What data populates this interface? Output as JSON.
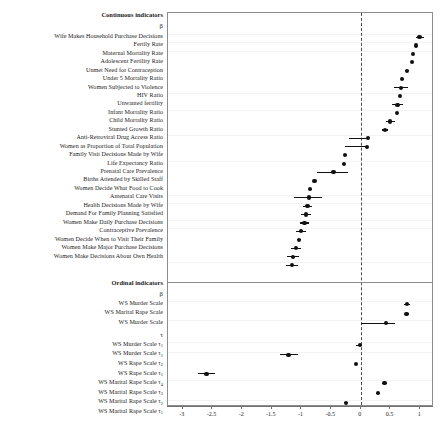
{
  "figure": {
    "type": "forest-plot",
    "sections": [
      {
        "id": "continuous",
        "title": "Continuous indicators",
        "param_header": "β"
      },
      {
        "id": "ordinal",
        "title": "Ordinal indicators",
        "param_header": "β",
        "second_param_header": "τ"
      }
    ]
  },
  "axis": {
    "ticks": [
      -3,
      -2.5,
      -2,
      -1.5,
      -1,
      -0.5,
      0,
      0.5,
      1
    ],
    "tick_labels": [
      "-3",
      "-2.5",
      "-2",
      "-1.5",
      "-1",
      "-0.5",
      "0",
      "0.5",
      "1"
    ],
    "min": -3.25,
    "max": 1.2,
    "reference_line": 0
  },
  "chart_data": {
    "type": "scatter",
    "title": "",
    "xlabel": "",
    "ylabel": "",
    "xlim": [
      -3.25,
      1.2
    ],
    "grid": false,
    "legend": "none",
    "reference_line": 0,
    "series": [
      {
        "name": "Continuous indicators",
        "header": "β",
        "points": [
          {
            "label": "Wife Makes Household Purchase Decisions",
            "estimate": 0.99,
            "ci_low": 0.93,
            "ci_high": 1.06
          },
          {
            "label": "Fertily Rate",
            "estimate": 0.93,
            "ci_low": 0.91,
            "ci_high": 0.95
          },
          {
            "label": "Maternal Mortality Rate",
            "estimate": 0.88,
            "ci_low": 0.86,
            "ci_high": 0.9
          },
          {
            "label": "Adolescent Fertility Rate",
            "estimate": 0.86,
            "ci_low": 0.84,
            "ci_high": 0.89
          },
          {
            "label": "Unmet Need for Contraception",
            "estimate": 0.78,
            "ci_low": 0.74,
            "ci_high": 0.82
          },
          {
            "label": "Under 5 Mortality Ratio",
            "estimate": 0.7,
            "ci_low": 0.68,
            "ci_high": 0.73
          },
          {
            "label": "Women Subjected to Violence",
            "estimate": 0.68,
            "ci_low": 0.56,
            "ci_high": 0.79
          },
          {
            "label": "HIV Ratio",
            "estimate": 0.66,
            "ci_low": 0.64,
            "ci_high": 0.68
          },
          {
            "label": "Unwanted fertility",
            "estimate": 0.62,
            "ci_low": 0.52,
            "ci_high": 0.71
          },
          {
            "label": "Infant Mortality Ratio",
            "estimate": 0.61,
            "ci_low": 0.59,
            "ci_high": 0.63
          },
          {
            "label": "Child Mortality Ratio",
            "estimate": 0.49,
            "ci_low": 0.42,
            "ci_high": 0.57
          },
          {
            "label": "Stunted Growth Ratio",
            "estimate": 0.41,
            "ci_low": 0.36,
            "ci_high": 0.46
          },
          {
            "label": "Anti-Retroviral Drug Access Ratio",
            "estimate": 0.12,
            "ci_low": -0.2,
            "ci_high": 0.14
          },
          {
            "label": "Women as Proportion of Total Population",
            "estimate": 0.1,
            "ci_low": -0.26,
            "ci_high": 0.12
          },
          {
            "label": "Family Visit Decisions Made by Wife",
            "estimate": -0.26,
            "ci_low": -0.29,
            "ci_high": -0.23
          },
          {
            "label": "Life Expectancy Ratio",
            "estimate": -0.29,
            "ci_low": -0.31,
            "ci_high": -0.27
          },
          {
            "label": "Prenatal Care Prevalence",
            "estimate": -0.46,
            "ci_low": -0.74,
            "ci_high": -0.22
          },
          {
            "label": "Births Attended by Skilled Staff",
            "estimate": -0.78,
            "ci_low": -0.8,
            "ci_high": -0.76
          },
          {
            "label": "Women Decide What Food to Cook",
            "estimate": -0.85,
            "ci_low": -0.88,
            "ci_high": -0.83
          },
          {
            "label": "Antenatal Care Visits",
            "estimate": -0.88,
            "ci_low": -1.12,
            "ci_high": -0.65
          },
          {
            "label": "Health Decisions Made by Wife",
            "estimate": -0.9,
            "ci_low": -0.98,
            "ci_high": -0.82
          },
          {
            "label": "Demand For Family Planning Satisfied",
            "estimate": -0.92,
            "ci_low": -1.0,
            "ci_high": -0.84
          },
          {
            "label": "Women Make Daily Purchase Decisions",
            "estimate": -0.95,
            "ci_low": -1.02,
            "ci_high": -0.88
          },
          {
            "label": "Contraceptive Prevalence",
            "estimate": -1.01,
            "ci_low": -1.1,
            "ci_high": -0.92
          },
          {
            "label": "Women Decide When to Visit Their Family",
            "estimate": -1.04,
            "ci_low": -1.07,
            "ci_high": -1.01
          },
          {
            "label": "Women Make Major Purchase Decisions",
            "estimate": -1.09,
            "ci_low": -1.18,
            "ci_high": -1.0
          },
          {
            "label": "Women Make Decisions About Own Health",
            "estimate": -1.14,
            "ci_low": -1.24,
            "ci_high": -1.04
          },
          {
            "label": "",
            "estimate": -1.16,
            "ci_low": -1.26,
            "ci_high": -1.06
          }
        ]
      },
      {
        "name": "Ordinal indicators",
        "header": "β",
        "points": [
          {
            "label": "WS Murder Scale",
            "estimate": 0.78,
            "ci_low": 0.73,
            "ci_high": 0.83
          },
          {
            "label": "WS Marital Rape Scale",
            "estimate": 0.77,
            "ci_low": 0.74,
            "ci_high": 0.81
          },
          {
            "label": "WS Murder Scale",
            "estimate": 0.42,
            "ci_low": 0.01,
            "ci_high": 0.58
          }
        ]
      },
      {
        "name": "Ordinal indicators thresholds",
        "header": "τ",
        "points": [
          {
            "label": "WS Murder Scale τ₁",
            "estimate": -0.02,
            "ci_low": -0.08,
            "ci_high": 0.02
          },
          {
            "label": "WS Murder Scale τ₁",
            "estimate": -1.22,
            "ci_low": -1.37,
            "ci_high": -1.06
          },
          {
            "label": "WS Rape Scale τ₂",
            "estimate": -0.08,
            "ci_low": -0.1,
            "ci_high": -0.06
          },
          {
            "label": "WS Rape Scale τ₁",
            "estimate": -2.6,
            "ci_low": -2.75,
            "ci_high": -2.45
          },
          {
            "label": "WS Marital Rape Scale τ₄",
            "estimate": 0.4,
            "ci_low": 0.36,
            "ci_high": 0.44
          },
          {
            "label": "WS Marital Rape Scale τ₃",
            "estimate": 0.29,
            "ci_low": 0.26,
            "ci_high": 0.32
          },
          {
            "label": "WS Marital Rape Scale τ₂",
            "estimate": -0.25,
            "ci_low": -0.28,
            "ci_high": -0.22
          },
          {
            "label": "WS Marital Rape Scale τ₁",
            "estimate": -2.37,
            "ci_low": -2.53,
            "ci_high": -2.21
          }
        ]
      }
    ]
  },
  "labels": {
    "continuous_title": "Continuous indicators",
    "continuous_beta": "β",
    "ordinal_title": "Ordinal indicators",
    "ordinal_beta": "β",
    "ordinal_tau": "τ",
    "continuous_items": [
      "Wife Makes Household Purchase Decisions",
      "Fertily Rate",
      "Maternal Mortality Rate",
      "Adolescent Fertility Rate",
      "Unmet Need for Contraception",
      "Under 5 Mortality Ratio",
      "Women Subjected to Violence",
      "HIV Ratio",
      "Unwanted fertility",
      "Infant Mortality Ratio",
      "Child Mortality Ratio",
      "Stunted Growth Ratio",
      "Anti-Retroviral Drug Access Ratio",
      "Women as Proportion of Total Population",
      "Family Visit Decisions Made by Wife",
      "Life Expectancy Ratio",
      "Prenatal Care Prevalence",
      "Births Attended by Skilled Staff",
      "Women Decide What Food to Cook",
      "Antenatal Care Visits",
      "Health Decisions Made by Wife",
      "Demand For Family Planning Satisfied",
      "Women Make Daily Purchase Decisions",
      "Contraceptive Prevalence",
      "Women Decide When to Visit Their Family",
      "Women Make Major Purchase Decisions",
      "Women Make Decisions About Own Health"
    ],
    "ordinal_beta_items": [
      "WS Murder Scale",
      "WS Marital Rape Scale",
      "WS Murder Scale"
    ],
    "ordinal_tau_items": [
      {
        "name": "WS Murder Scale ",
        "sub": "1"
      },
      {
        "name": "WS Murder Scale ",
        "sub": "1"
      },
      {
        "name": "WS Rape Scale ",
        "sub": "2"
      },
      {
        "name": "WS Rape Scale ",
        "sub": "1"
      },
      {
        "name": "WS Marital Rape Scale ",
        "sub": "4"
      },
      {
        "name": "WS Marital Rape Scale ",
        "sub": "3"
      },
      {
        "name": "WS Marital Rape Scale ",
        "sub": "2"
      },
      {
        "name": "WS Marital Rape Scale ",
        "sub": "1"
      }
    ]
  },
  "colors": {
    "point": "#111111",
    "border": "#8d8d8d",
    "reference": "#4b4b4b",
    "background": "#ffffff"
  }
}
